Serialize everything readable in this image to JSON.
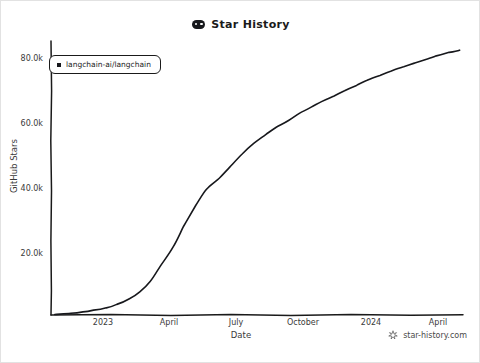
{
  "title": {
    "text": "Star History",
    "icon": "star-history-logo-icon"
  },
  "legend": {
    "entries": [
      {
        "label": "langchain-ai/langchain",
        "color": "#17181c",
        "marker": "square"
      }
    ]
  },
  "watermark": {
    "text": "star-history.com",
    "icon": "sparkle-icon"
  },
  "axes": {
    "x_title": "Date",
    "y_title": "GitHub Stars"
  },
  "chart_data": {
    "type": "line",
    "title": "Star History",
    "xlabel": "Date",
    "ylabel": "GitHub Stars",
    "grid": false,
    "legend_position": "top-left",
    "line_color": "#17181c",
    "x_tick_labels": [
      "2023",
      "April",
      "July",
      "October",
      "2024",
      "April"
    ],
    "x_tick_values": [
      "2023-01",
      "2023-04",
      "2023-07",
      "2023-10",
      "2024-01",
      "2024-04"
    ],
    "y_tick_labels": [
      "20.0k",
      "40.0k",
      "60.0k",
      "80.0k"
    ],
    "y_tick_values": [
      20000,
      40000,
      60000,
      80000
    ],
    "ylim": [
      0,
      86000
    ],
    "xlim": [
      "2022-10-20",
      "2024-04-20"
    ],
    "series": [
      {
        "name": "langchain-ai/langchain",
        "color": "#17181c",
        "x": [
          "2022-10-25",
          "2022-11-15",
          "2022-12-01",
          "2022-12-15",
          "2023-01-01",
          "2023-01-15",
          "2023-02-01",
          "2023-02-15",
          "2023-03-01",
          "2023-03-15",
          "2023-04-01",
          "2023-04-15",
          "2023-05-01",
          "2023-05-15",
          "2023-06-01",
          "2023-06-15",
          "2023-07-01",
          "2023-07-15",
          "2023-08-01",
          "2023-08-15",
          "2023-09-01",
          "2023-09-15",
          "2023-10-01",
          "2023-10-15",
          "2023-11-01",
          "2023-11-15",
          "2023-12-01",
          "2023-12-15",
          "2024-01-01",
          "2024-01-15",
          "2024-02-01",
          "2024-02-15",
          "2024-03-01",
          "2024-03-15",
          "2024-04-01",
          "2024-04-15"
        ],
        "y": [
          200,
          500,
          900,
          1400,
          2100,
          3200,
          5000,
          7200,
          10500,
          15500,
          21500,
          28000,
          34500,
          39500,
          43000,
          46500,
          50500,
          53500,
          56500,
          58800,
          61000,
          63200,
          65200,
          67000,
          68800,
          70500,
          72200,
          73800,
          75300,
          76600,
          77900,
          79000,
          80100,
          81200,
          82300,
          83000
        ],
        "final_value": 83000
      }
    ]
  },
  "geometry": {
    "plot_left": 50,
    "plot_right": 462,
    "plot_top": 40,
    "plot_bottom": 314,
    "y_pixel_per_k": 3.25,
    "x_tick_pixels": [
      102,
      168,
      235,
      302,
      370,
      437
    ],
    "y_tick_pixels": [
      252,
      187,
      122,
      57
    ]
  }
}
